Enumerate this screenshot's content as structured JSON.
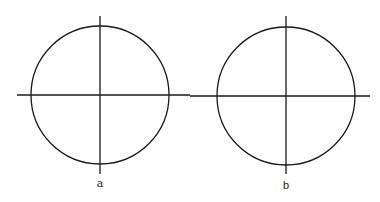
{
  "figures": [
    {
      "label": "a",
      "circle": {
        "cx": 100,
        "cy": 95,
        "r": 69
      },
      "h_axis": {
        "x1": 17,
        "x2": 190,
        "y": 95
      },
      "v_axis": {
        "x": 100,
        "y1": 16,
        "y2": 174
      },
      "label_pos": {
        "x": 100,
        "y": 178
      }
    },
    {
      "label": "b",
      "circle": {
        "cx": 286,
        "cy": 96,
        "r": 69
      },
      "h_axis": {
        "x1": 190,
        "x2": 370,
        "y": 96
      },
      "v_axis": {
        "x": 286,
        "y1": 16,
        "y2": 174
      },
      "label_pos": {
        "x": 286,
        "y": 180
      }
    }
  ],
  "colors": {
    "stroke": "#1a1a1a",
    "background": "#ffffff"
  }
}
